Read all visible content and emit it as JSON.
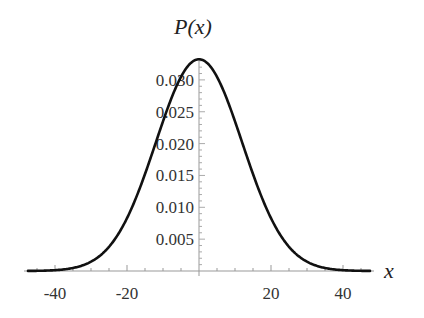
{
  "chart_data": {
    "type": "line",
    "title": "",
    "xlabel": "x",
    "ylabel": "P(x)",
    "xlim": [
      -47.5,
      47.5
    ],
    "ylim": [
      0,
      0.034
    ],
    "grid": false,
    "legend": null,
    "x_ticks": [
      -40,
      -20,
      20,
      40
    ],
    "x_tick_labels": [
      "-40",
      "-20",
      "20",
      "40"
    ],
    "y_ticks": [
      0.005,
      0.01,
      0.015,
      0.02,
      0.025,
      0.03
    ],
    "y_tick_labels": [
      "0.005",
      "0.010",
      "0.015",
      "0.020",
      "0.025",
      "0.030"
    ],
    "series": [
      {
        "name": "P(x)",
        "function": "normal pdf, mean 0, sigma 12",
        "x": [
          -47.5,
          -40,
          -35,
          -30,
          -25,
          -20,
          -15,
          -10,
          -5,
          0,
          5,
          10,
          15,
          20,
          25,
          30,
          35,
          40,
          47.5
        ],
        "values": [
          0.00013,
          0.00051,
          0.00115,
          0.00292,
          0.00378,
          0.00829,
          0.01522,
          0.02348,
          0.03043,
          0.03324,
          0.03043,
          0.02348,
          0.01522,
          0.00829,
          0.00378,
          0.00146,
          0.00047,
          0.00013,
          1e-05
        ]
      }
    ]
  }
}
